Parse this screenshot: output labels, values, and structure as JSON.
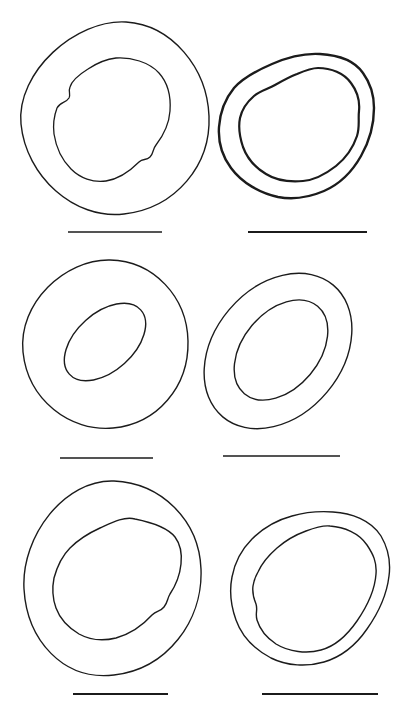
{
  "page": {
    "background": "#ffffff",
    "ink": "#1b1b1b",
    "width": 405,
    "height": 708
  },
  "plate": {
    "viewbox": "0 0 405 708",
    "shapes": [
      {
        "name": "figure1-outer-wall",
        "type": "path",
        "stroke_width": 1.4,
        "d": "M 126 22 C 172 25 207 68 209 116 C 211 165 176 208 124 214 C 74 220 26 176 21 124 C 16 72 76 19 126 22 Z"
      },
      {
        "name": "figure1-inner-lumen",
        "type": "path",
        "stroke_width": 1.3,
        "d": "M 116 58 C 131 57 149 62 159 73 C 168 83 171 97 170 111 C 169 125 163 136 156 145 C 152 150 154 153 150 157 C 146 161 143 158 139 162 C 130 171 119 179 106 181 C 93 183 80 178 71 169 C 62 160 56 147 54 134 C 53 126 54 116 57 108 C 60 102 66 103 69 98 C 71 94 68 92 70 87 C 72 80 80 74 88 69 C 97 63 107 59 116 58 Z"
      },
      {
        "name": "figure2-outer-wall",
        "type": "path",
        "stroke_width": 2.4,
        "d": "M 320 54 C 338 55 354 60 363 73 C 371 84 374 96 374 108 C 374 124 369 142 361 156 C 352 172 340 184 324 191 C 310 197 294 200 278 197 C 260 193 242 183 231 168 C 222 156 218 142 219 127 C 220 112 225 99 234 88 C 244 77 258 70 272 64 C 288 57 304 53 320 54 Z"
      },
      {
        "name": "figure2-inner-lumen",
        "type": "path",
        "stroke_width": 2.2,
        "d": "M 318 68 C 331 68 344 73 351 83 C 357 91 360 101 359 111 C 358 119 360 127 357 136 C 353 148 346 158 336 166 C 327 173 315 180 303 181 C 291 182 277 181 266 174 C 256 168 247 158 243 147 C 240 138 238 128 240 118 C 242 109 247 102 254 96 C 260 91 268 89 275 85 C 282 81 289 77 297 74 C 304 71 311 68 318 68 Z"
      },
      {
        "name": "figure3-outer-wall",
        "type": "path",
        "stroke_width": 1.4,
        "d": "M 110 260 C 154 261 187 297 188 341 C 189 387 157 424 113 428 C 70 432 28 400 23 352 C 18 303 65 259 110 260 Z"
      },
      {
        "name": "figure3-inner-lumen",
        "type": "ellipse",
        "stroke_width": 1.4,
        "cx": 105,
        "cy": 342,
        "rx": 48,
        "ry": 29,
        "rotate": -42
      },
      {
        "name": "figure4-outer-wall",
        "type": "ellipse",
        "stroke_width": 1.4,
        "cx": 278,
        "cy": 351,
        "rx": 86,
        "ry": 64,
        "rotate": -50
      },
      {
        "name": "figure4-inner-lumen",
        "type": "ellipse",
        "stroke_width": 1.4,
        "cx": 281,
        "cy": 350,
        "rx": 57,
        "ry": 38,
        "rotate": -50
      },
      {
        "name": "figure5-outer-wall",
        "type": "path",
        "stroke_width": 1.4,
        "d": "M 114 481 C 160 483 199 519 201 569 C 203 621 167 669 114 675 C 63 681 27 640 24 589 C 21 536 65 479 114 481 Z"
      },
      {
        "name": "figure5-inner-lumen",
        "type": "path",
        "stroke_width": 1.4,
        "d": "M 135 519 C 150 522 167 527 175 537 C 181 545 182 555 181 564 C 180 574 176 585 170 594 C 167 599 168 602 164 607 C 160 612 157 610 152 615 C 143 625 130 634 116 638 C 104 641 90 640 79 634 C 69 628 60 619 56 608 C 52 597 52 588 54 578 C 57 567 62 556 70 548 C 78 540 89 533 100 528 C 111 523 124 516 135 519 Z"
      },
      {
        "name": "figure6-outer-wall",
        "type": "path",
        "stroke_width": 1.4,
        "d": "M 333 512 C 351 513 371 520 381 536 C 388 548 391 561 389 576 C 387 593 379 612 367 629 C 356 645 341 657 324 662 C 307 667 287 666 271 658 C 256 650 242 637 236 620 C 231 606 229 592 232 577 C 235 561 242 549 252 539 C 263 528 277 520 292 516 C 306 512 319 511 333 512 Z"
      },
      {
        "name": "figure6-inner-lumen",
        "type": "path",
        "stroke_width": 1.4,
        "d": "M 330 526 C 344 527 359 533 367 545 C 373 554 377 562 376 574 C 375 589 368 605 357 621 C 348 634 336 646 321 650 C 307 654 289 652 276 644 C 267 638 260 630 257 620 C 255 613 258 610 256 604 C 254 599 252 593 253 586 C 254 580 255 577 258 572 C 262 563 269 555 277 548 C 285 541 295 535 306 531 C 314 528 322 525 330 526 Z"
      }
    ],
    "scale_bars": [
      {
        "name": "scale-bar-figure1",
        "x1": 68,
        "x2": 162,
        "y": 232,
        "stroke_width": 1.6
      },
      {
        "name": "scale-bar-figure2",
        "x1": 248,
        "x2": 367,
        "y": 232,
        "stroke_width": 2.2
      },
      {
        "name": "scale-bar-figure3",
        "x1": 60,
        "x2": 153,
        "y": 458,
        "stroke_width": 1.6
      },
      {
        "name": "scale-bar-figure4",
        "x1": 223,
        "x2": 340,
        "y": 456,
        "stroke_width": 1.6
      },
      {
        "name": "scale-bar-figure5",
        "x1": 73,
        "x2": 168,
        "y": 694,
        "stroke_width": 2.0
      },
      {
        "name": "scale-bar-figure6",
        "x1": 262,
        "x2": 378,
        "y": 694,
        "stroke_width": 2.0
      }
    ]
  }
}
